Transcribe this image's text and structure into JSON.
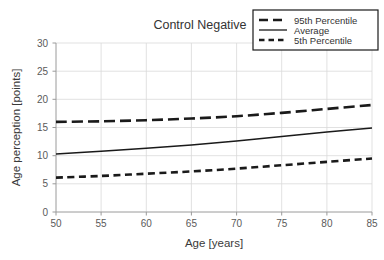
{
  "chart_data": {
    "type": "line",
    "title": "Control Negative",
    "xlabel": "Age [years]",
    "ylabel": "Age perception [points]",
    "xlim": [
      50,
      85
    ],
    "ylim": [
      0,
      30
    ],
    "xticks": [
      50,
      55,
      60,
      65,
      70,
      75,
      80,
      85
    ],
    "yticks": [
      0,
      5,
      10,
      15,
      20,
      25,
      30
    ],
    "grid": true,
    "legend_position": "top-right",
    "x": [
      50,
      55,
      60,
      65,
      70,
      75,
      80,
      85
    ],
    "series": [
      {
        "name": "95th Percentile",
        "style": "long-dash",
        "color": "#1a1a1a",
        "values": [
          16.0,
          16.1,
          16.3,
          16.6,
          17.0,
          17.6,
          18.3,
          19.0
        ]
      },
      {
        "name": "Average",
        "style": "solid",
        "color": "#1a1a1a",
        "values": [
          10.3,
          10.8,
          11.3,
          11.9,
          12.6,
          13.4,
          14.2,
          14.9
        ]
      },
      {
        "name": "5th Percentile",
        "style": "short-dash",
        "color": "#1a1a1a",
        "values": [
          6.1,
          6.4,
          6.8,
          7.2,
          7.7,
          8.3,
          8.9,
          9.5
        ]
      }
    ]
  },
  "axes": {
    "x_tick_labels": [
      "50",
      "55",
      "60",
      "65",
      "70",
      "75",
      "80",
      "85"
    ],
    "y_tick_labels": [
      "0",
      "5",
      "10",
      "15",
      "20",
      "25",
      "30"
    ],
    "x_axis_title": "Age [years]",
    "y_axis_title": "Age perception [points]"
  },
  "title": {
    "text": "Control Negative"
  },
  "legend": {
    "entries": [
      {
        "label": "95th Percentile",
        "style": "long-dash"
      },
      {
        "label": "Average",
        "style": "solid"
      },
      {
        "label": "5th Percentile",
        "style": "short-dash"
      }
    ]
  }
}
